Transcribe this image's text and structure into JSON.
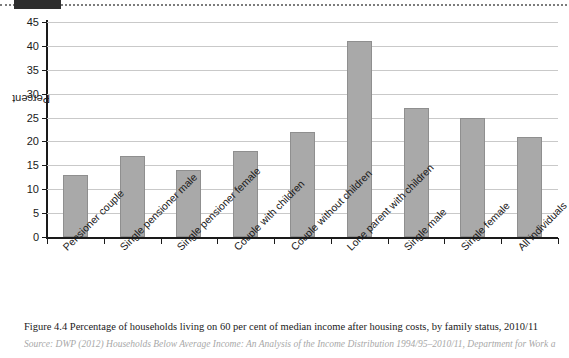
{
  "page": {
    "top_rule_style": "dotted",
    "redaction_present": true
  },
  "figure": {
    "caption": "Figure 4.4 Percentage of households living on 60 per cent of median income after housing costs, by family status, 2010/11",
    "source": "Source: DWP (2012) Households Below Average Income: An Analysis of the Income Distribution 1994/95–2010/11, Department for Work a"
  },
  "colors": {
    "bar_fill": "#a9a9a9",
    "bar_stroke": "#8f8f8f",
    "gridline": "#c9c9c9",
    "axis": "#1a1a1a",
    "redaction": "#2e2e2e"
  },
  "chart_data": {
    "type": "bar",
    "title": "",
    "xlabel": "",
    "ylabel": "Percent",
    "ylim": [
      0,
      45
    ],
    "yticks": [
      0,
      5,
      10,
      15,
      20,
      25,
      30,
      35,
      40,
      45
    ],
    "grid": true,
    "legend": null,
    "categories": [
      "Pensioner couple",
      "Single pensioner male",
      "Single pensioner female",
      "Couple with children",
      "Couple without children",
      "Lone parent with children",
      "Single male",
      "Single female",
      "All individuals"
    ],
    "values": [
      13,
      17,
      14,
      18,
      22,
      41,
      27,
      25,
      21
    ],
    "units": "percent"
  }
}
